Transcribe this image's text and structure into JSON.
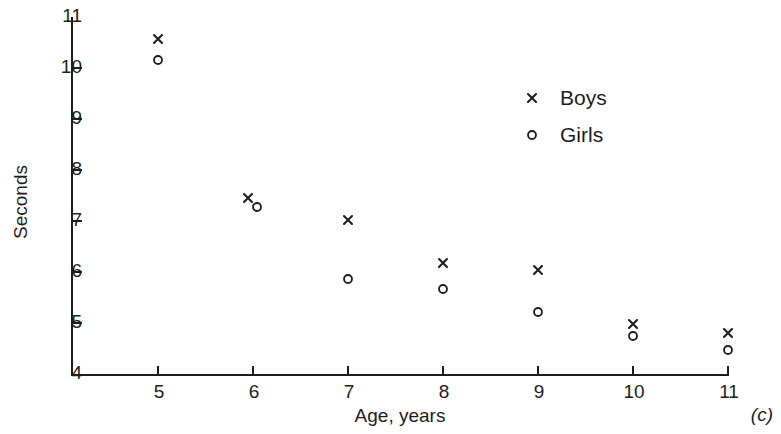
{
  "chart_data": {
    "type": "scatter",
    "title": "",
    "panel_label": "(c)",
    "xlabel": "Age, years",
    "ylabel": "Seconds",
    "xlim": [
      4.5,
      11.3
    ],
    "ylim": [
      4,
      11
    ],
    "xticks": [
      5,
      6,
      7,
      8,
      9,
      10,
      11
    ],
    "yticks": [
      4,
      5,
      6,
      7,
      8,
      9,
      10,
      11
    ],
    "xticklabels": [
      "5",
      "6",
      "7",
      "8",
      "9",
      "10",
      "11"
    ],
    "yticklabels": [
      "4",
      "5",
      "6",
      "7",
      "8",
      "9",
      "10",
      "11"
    ],
    "grid": false,
    "legend_position": "upper right",
    "x": [
      5,
      6,
      7,
      8,
      9,
      10,
      11
    ],
    "series": [
      {
        "name": "Boys",
        "marker": "x",
        "color": "#1d1d1d",
        "values": [
          10.57,
          7.45,
          7.02,
          6.18,
          6.04,
          4.98,
          4.8
        ]
      },
      {
        "name": "Girls",
        "marker": "o",
        "color": "#1d1d1d",
        "values": [
          10.15,
          7.28,
          5.87,
          5.67,
          5.22,
          4.75,
          4.48
        ]
      }
    ]
  }
}
